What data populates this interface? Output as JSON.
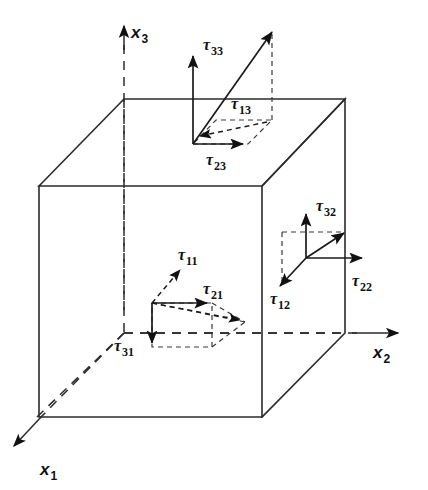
{
  "figure": {
    "kind": "stress-tensor-cube-diagram",
    "background_color": "#ffffff",
    "line_color": "#2b2b2b",
    "width": 428,
    "height": 490
  },
  "axes": [
    {
      "id": "x1",
      "symbol": "x",
      "subscript": "1",
      "label": "x1",
      "direction": "down-left",
      "line_style": "dashed",
      "label_x": 40,
      "label_y": 475
    },
    {
      "id": "x2",
      "symbol": "x",
      "subscript": "2",
      "label": "x2",
      "direction": "right",
      "line_style": "dashed",
      "label_x": 373,
      "label_y": 358
    },
    {
      "id": "x3",
      "symbol": "x",
      "subscript": "3",
      "label": "x3",
      "direction": "up",
      "line_style": "dashed",
      "label_x": 131,
      "label_y": 38
    }
  ],
  "faces": [
    {
      "id": "top-face",
      "name": "top-face-x3-normal",
      "normal_axis": "x3",
      "components": [
        {
          "id": "tau33",
          "symbol": "τ",
          "subscript": "33",
          "label": "τ33",
          "direction": "up",
          "style": "solid",
          "label_x": 203,
          "label_y": 50
        },
        {
          "id": "tau13",
          "symbol": "τ",
          "subscript": "13",
          "label": "τ13",
          "direction": "down-left-depth",
          "style": "dashed",
          "label_x": 231,
          "label_y": 109
        },
        {
          "id": "tau23",
          "symbol": "τ",
          "subscript": "23",
          "label": "τ23",
          "direction": "right",
          "style": "solid",
          "label_x": 206,
          "label_y": 165
        }
      ]
    },
    {
      "id": "front-face",
      "name": "front-face-x1-normal",
      "normal_axis": "x1",
      "components": [
        {
          "id": "tau11",
          "symbol": "τ",
          "subscript": "11",
          "label": "τ11",
          "direction": "up-right-depth",
          "style": "dashed",
          "label_x": 178,
          "label_y": 260
        },
        {
          "id": "tau21",
          "symbol": "τ",
          "subscript": "21",
          "label": "τ21",
          "direction": "right",
          "style": "solid",
          "label_x": 203,
          "label_y": 294
        },
        {
          "id": "tau31",
          "symbol": "τ",
          "subscript": "31",
          "label": "τ31",
          "direction": "down",
          "style": "solid",
          "label_x": 114,
          "label_y": 351
        }
      ]
    },
    {
      "id": "right-face",
      "name": "right-face-x2-normal",
      "normal_axis": "x2",
      "components": [
        {
          "id": "tau32",
          "symbol": "τ",
          "subscript": "32",
          "label": "τ32",
          "direction": "up",
          "style": "solid",
          "label_x": 316,
          "label_y": 211
        },
        {
          "id": "tau22",
          "symbol": "τ",
          "subscript": "22",
          "label": "τ22",
          "direction": "right",
          "style": "solid",
          "label_x": 352,
          "label_y": 286
        },
        {
          "id": "tau12",
          "symbol": "τ",
          "subscript": "12",
          "label": "τ12",
          "direction": "down-left-depth",
          "style": "solid",
          "label_x": 270,
          "label_y": 304
        }
      ]
    }
  ],
  "resultants": [
    {
      "id": "resultant-top",
      "face": "top-face",
      "description": "traction vector on top face"
    },
    {
      "id": "resultant-front",
      "face": "front-face",
      "description": "traction vector on front face"
    },
    {
      "id": "resultant-right",
      "face": "right-face",
      "description": "traction vector on right face"
    }
  ]
}
